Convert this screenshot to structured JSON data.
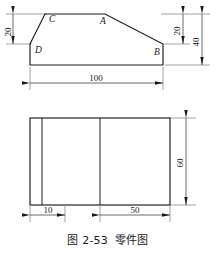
{
  "figure": {
    "caption_number": "图 2-53",
    "caption_title": "零件图",
    "line_color": "#1a1a1a",
    "background": "#ffffff"
  },
  "front_view": {
    "name": "front-view",
    "point_labels": [
      {
        "id": "C",
        "text": "C",
        "x": 49,
        "y": 22
      },
      {
        "id": "A",
        "text": "A",
        "x": 100,
        "y": 24
      },
      {
        "id": "D",
        "text": "D",
        "x": 35,
        "y": 53
      },
      {
        "id": "B",
        "text": "B",
        "x": 154,
        "y": 55
      }
    ],
    "outline": [
      {
        "x": 30,
        "y": 44
      },
      {
        "x": 45,
        "y": 14
      },
      {
        "x": 105,
        "y": 14
      },
      {
        "x": 163,
        "y": 44
      },
      {
        "x": 163,
        "y": 65
      },
      {
        "x": 30,
        "y": 65
      }
    ],
    "dimensions": [
      {
        "id": "left-height",
        "value": "20",
        "orientation": "vertical",
        "from": 14,
        "to": 44,
        "at_x": 13
      },
      {
        "id": "right-upper-height",
        "value": "20",
        "orientation": "vertical",
        "from": 14,
        "to": 44,
        "at_x": 183
      },
      {
        "id": "right-total-height",
        "value": "40",
        "orientation": "vertical",
        "from": 14,
        "to": 65,
        "at_x": 202
      },
      {
        "id": "overall-length",
        "value": "100",
        "orientation": "horizontal",
        "from": 30,
        "to": 163,
        "at_y": 83
      }
    ]
  },
  "top_view": {
    "name": "top-view",
    "rect": {
      "x": 30,
      "y": 118,
      "width": 140,
      "height": 87
    },
    "inner_lines": [
      {
        "id": "rib-line-1",
        "x": 42
      },
      {
        "id": "rib-line-2",
        "x": 100
      }
    ],
    "dimensions": [
      {
        "id": "width-10",
        "value": "10",
        "orientation": "horizontal",
        "from": 30,
        "to": 65,
        "at_y": 215
      },
      {
        "id": "width-50",
        "value": "50",
        "orientation": "horizontal",
        "from": 100,
        "to": 170,
        "at_y": 215
      },
      {
        "id": "depth-60",
        "value": "60",
        "orientation": "vertical",
        "from": 118,
        "to": 205,
        "at_x": 186
      }
    ]
  }
}
